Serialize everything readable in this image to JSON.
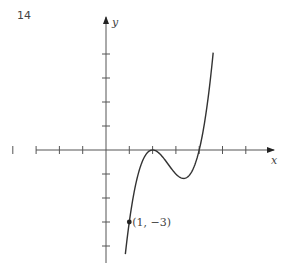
{
  "figure_number": "14",
  "chart_data": {
    "type": "line",
    "title": "",
    "xlabel": "x",
    "ylabel": "y",
    "function": "y = (x-2)^2 (x-4)",
    "x_ticks": [
      -4,
      -3,
      -2,
      -1,
      1,
      2,
      3,
      4,
      5,
      6
    ],
    "y_ticks": [
      -4,
      -3,
      -2,
      -1,
      1,
      2,
      3,
      4
    ],
    "tick_labels_shown": false,
    "xlim": [
      -3,
      7
    ],
    "ylim": [
      -4.7,
      5.4
    ],
    "grid": false,
    "series": [
      {
        "name": "curve",
        "x": [
          0.83,
          1,
          1.5,
          2,
          2.5,
          3,
          3.33,
          3.5,
          4,
          4.3,
          4.6
        ],
        "y": [
          -4.4,
          -3,
          -0.63,
          0,
          -0.38,
          -1,
          -1.19,
          -1.13,
          0,
          1.36,
          4.06
        ]
      }
    ],
    "annotations": [
      {
        "label": "(1, −3)",
        "x": 1,
        "y": -3,
        "marker": "dot"
      }
    ],
    "key_points": {
      "local_max": [
        2,
        0
      ],
      "local_min": [
        3.33,
        -1.19
      ],
      "x_intercepts": [
        2,
        4
      ]
    }
  },
  "labels": {
    "x_axis": "x",
    "y_axis": "y",
    "point": "(1, −3)"
  }
}
